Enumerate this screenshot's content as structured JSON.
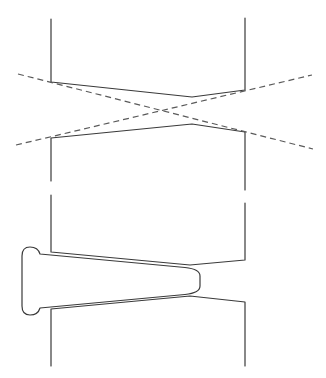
{
  "diagram": {
    "colors": {
      "background": "#ffffff",
      "line": "#3a3a3a",
      "dashed": "#5a5a5a"
    },
    "panel_top": {
      "label": "",
      "upper_block": {
        "left_x": 51,
        "right_x": 245,
        "top_y": 19,
        "bottom_left": [
          51,
          82
        ],
        "apex": [
          192,
          97
        ],
        "bottom_right": [
          245,
          90
        ]
      },
      "lower_block": {
        "left_x": 51,
        "right_x": 245,
        "top_left": [
          51,
          138
        ],
        "apex": [
          192,
          124
        ],
        "top_right": [
          245,
          132
        ],
        "bottom_left_y": 181,
        "bottom_right_y": 190
      },
      "dashed_lines": [
        {
          "from": [
            18,
            74
          ],
          "to": [
            313,
            149
          ]
        },
        {
          "from": [
            16,
            145
          ],
          "to": [
            312,
            75
          ]
        }
      ]
    },
    "panel_bottom": {
      "label": "",
      "upper_block": {
        "left_x": 51,
        "right_x": 245,
        "top_left_y": 195,
        "top_right_y": 203,
        "bottom_left": [
          51,
          252
        ],
        "apex": [
          190,
          265
        ],
        "bottom_right": [
          245,
          260
        ]
      },
      "lower_block": {
        "left_x": 51,
        "right_x": 245,
        "top_left": [
          51,
          309
        ],
        "apex": [
          190,
          296
        ],
        "top_right": [
          245,
          302
        ],
        "bottom_y": 366
      },
      "wedge": {
        "head_left_x": 22,
        "head_top_y": 247,
        "head_bottom_y": 315,
        "tip_x": 200,
        "tip_top_y": 269,
        "tip_bottom_y": 293
      }
    }
  }
}
